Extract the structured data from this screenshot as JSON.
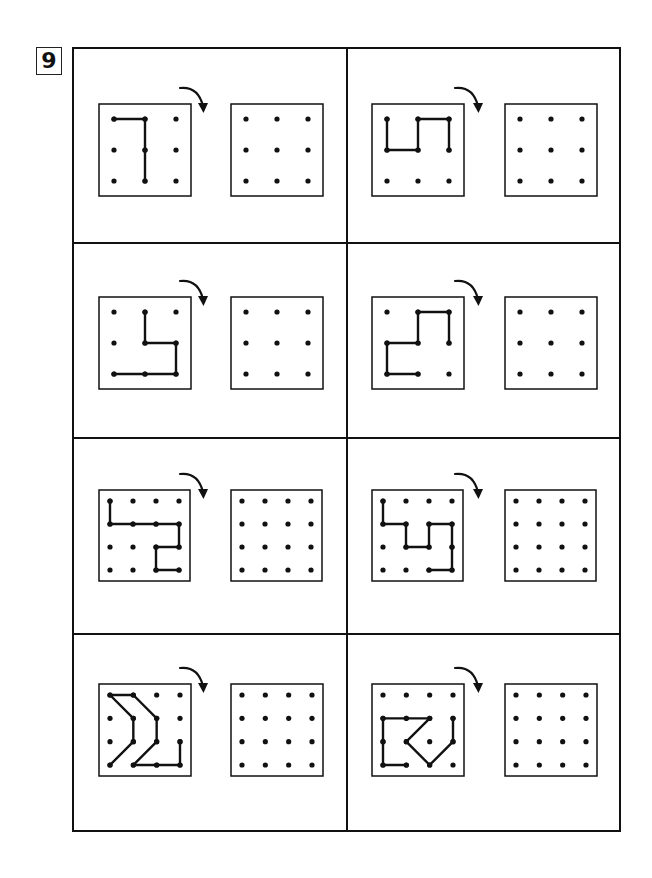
{
  "page": {
    "number": "9"
  },
  "layout": {
    "frame": {
      "left": 72,
      "top": 47,
      "right": 621,
      "bottom": 832
    },
    "column_divider_x": 347,
    "row_dividers_y": [
      243,
      438,
      634
    ],
    "columns": [
      {
        "source_box_x": 99,
        "target_box_x": 231,
        "arrow_x": 180
      },
      {
        "source_box_x": 372,
        "target_box_x": 505,
        "arrow_x": 455
      }
    ],
    "rows": [
      {
        "box_y": 104,
        "box_size": 92
      },
      {
        "box_y": 297,
        "box_size": 92
      },
      {
        "box_y": 490,
        "box_size": 91
      },
      {
        "box_y": 684,
        "box_size": 92
      }
    ]
  },
  "style": {
    "line_color": "#111111",
    "dot_color": "#111111"
  },
  "puzzles": [
    {
      "id": 1,
      "row": 0,
      "col": 0,
      "grid": 3,
      "instruction": "rotate-clockwise",
      "path": [
        [
          0,
          0
        ],
        [
          1,
          0
        ],
        [
          1,
          1
        ],
        [
          1,
          2
        ]
      ]
    },
    {
      "id": 2,
      "row": 0,
      "col": 1,
      "grid": 3,
      "instruction": "rotate-clockwise",
      "path": [
        [
          0,
          0
        ],
        [
          0,
          1
        ],
        [
          1,
          1
        ],
        [
          1,
          0
        ],
        [
          2,
          0
        ],
        [
          2,
          1
        ]
      ]
    },
    {
      "id": 3,
      "row": 1,
      "col": 0,
      "grid": 3,
      "instruction": "rotate-clockwise",
      "path": [
        [
          1,
          0
        ],
        [
          1,
          1
        ],
        [
          2,
          1
        ],
        [
          2,
          2
        ],
        [
          1,
          2
        ],
        [
          0,
          2
        ]
      ]
    },
    {
      "id": 4,
      "row": 1,
      "col": 1,
      "grid": 3,
      "instruction": "rotate-clockwise",
      "path": [
        [
          2,
          1
        ],
        [
          2,
          0
        ],
        [
          1,
          0
        ],
        [
          1,
          1
        ],
        [
          0,
          1
        ],
        [
          0,
          2
        ],
        [
          1,
          2
        ]
      ]
    },
    {
      "id": 5,
      "row": 2,
      "col": 0,
      "grid": 4,
      "instruction": "rotate-clockwise",
      "path": [
        [
          0,
          0
        ],
        [
          0,
          1
        ],
        [
          1,
          1
        ],
        [
          2,
          1
        ],
        [
          3,
          1
        ],
        [
          3,
          2
        ],
        [
          2,
          2
        ],
        [
          2,
          3
        ],
        [
          3,
          3
        ]
      ]
    },
    {
      "id": 6,
      "row": 2,
      "col": 1,
      "grid": 4,
      "instruction": "rotate-clockwise",
      "path": [
        [
          0,
          0
        ],
        [
          0,
          1
        ],
        [
          1,
          1
        ],
        [
          1,
          2
        ],
        [
          2,
          2
        ],
        [
          2,
          1
        ],
        [
          3,
          1
        ],
        [
          3,
          2
        ],
        [
          3,
          3
        ],
        [
          2,
          3
        ]
      ]
    },
    {
      "id": 7,
      "row": 3,
      "col": 0,
      "grid": 4,
      "instruction": "rotate-clockwise",
      "path": [
        [
          0,
          3
        ],
        [
          1,
          2
        ],
        [
          1,
          1
        ],
        [
          0,
          0
        ],
        [
          1,
          0
        ],
        [
          2,
          1
        ],
        [
          2,
          2
        ],
        [
          1,
          3
        ],
        [
          2,
          3
        ],
        [
          3,
          3
        ],
        [
          3,
          2
        ]
      ]
    },
    {
      "id": 8,
      "row": 3,
      "col": 1,
      "grid": 4,
      "instruction": "rotate-clockwise",
      "path": [
        [
          1,
          3
        ],
        [
          0,
          3
        ],
        [
          0,
          2
        ],
        [
          0,
          1
        ],
        [
          1,
          1
        ],
        [
          2,
          1
        ],
        [
          1,
          2
        ],
        [
          2,
          3
        ],
        [
          3,
          2
        ],
        [
          3,
          1
        ]
      ]
    }
  ]
}
